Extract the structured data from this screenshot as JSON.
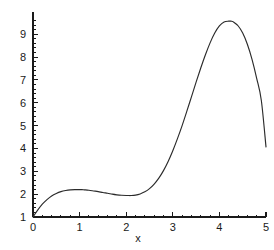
{
  "chart_data": {
    "type": "line",
    "title": "",
    "subtitle": "",
    "xlabel": "x",
    "ylabel": "",
    "xlim": [
      0,
      5
    ],
    "ylim": [
      1,
      9.9
    ],
    "grid": false,
    "legend": null,
    "x_ticks": [
      0,
      1,
      2,
      3,
      4,
      5
    ],
    "x_tick_labels": [
      "0",
      "1",
      "2",
      "3",
      "4",
      "5"
    ],
    "y_ticks": [
      1,
      2,
      3,
      4,
      5,
      6,
      7,
      8,
      9
    ],
    "y_tick_labels": [
      "1",
      "2",
      "3",
      "4",
      "5",
      "6",
      "7",
      "8",
      "9"
    ],
    "x_minor_tick_step": 0.2,
    "y_minor_tick_step": 0.2,
    "annotations": [],
    "series": [
      {
        "name": "curve",
        "color": "#2b2b2b",
        "x": [
          0,
          0.1,
          0.2,
          0.3,
          0.4,
          0.5,
          0.6,
          0.7,
          0.8,
          0.9,
          1.0,
          1.05,
          1.1,
          1.2,
          1.3,
          1.4,
          1.5,
          1.6,
          1.7,
          1.8,
          1.9,
          2.0,
          2.05,
          2.1,
          2.2,
          2.3,
          2.4,
          2.5,
          2.6,
          2.7,
          2.8,
          2.9,
          3.0,
          3.1,
          3.2,
          3.3,
          3.4,
          3.5,
          3.6,
          3.7,
          3.8,
          3.9,
          4.0,
          4.1,
          4.2,
          4.25,
          4.3,
          4.4,
          4.5,
          4.6,
          4.7,
          4.8,
          4.9,
          5.0
        ],
        "y": [
          1.0,
          1.3,
          1.56,
          1.76,
          1.92,
          2.03,
          2.11,
          2.16,
          2.19,
          2.2,
          2.2,
          2.2,
          2.19,
          2.17,
          2.14,
          2.11,
          2.07,
          2.04,
          2.0,
          1.97,
          1.95,
          1.94,
          1.94,
          1.94,
          1.96,
          2.01,
          2.1,
          2.24,
          2.44,
          2.7,
          3.03,
          3.43,
          3.9,
          4.43,
          5.0,
          5.62,
          6.26,
          6.9,
          7.52,
          8.1,
          8.62,
          9.05,
          9.36,
          9.53,
          9.57,
          9.57,
          9.54,
          9.37,
          9.05,
          8.56,
          7.9,
          7.07,
          6.1,
          4.07
        ]
      }
    ]
  },
  "axis": {
    "x_title": "x",
    "y_title": ""
  }
}
